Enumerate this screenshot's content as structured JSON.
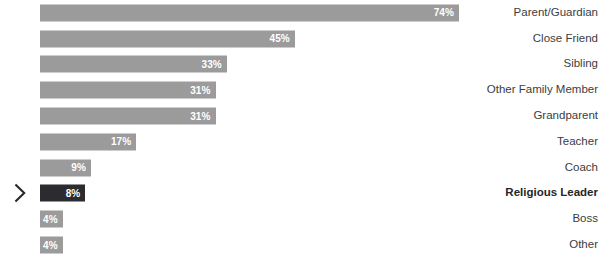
{
  "chart_data": {
    "type": "bar",
    "orientation": "horizontal",
    "title": "",
    "subtitle": "",
    "xlabel": "",
    "ylabel": "",
    "xlim": [
      0,
      74
    ],
    "grid": false,
    "legend": null,
    "value_suffix": "%",
    "categories": [
      "Parent/Guardian",
      "Close Friend",
      "Sibling",
      "Other Family Member",
      "Grandparent",
      "Teacher",
      "Coach",
      "Religious Leader",
      "Boss",
      "Other"
    ],
    "values": [
      74,
      45,
      33,
      31,
      31,
      17,
      9,
      8,
      4,
      4
    ],
    "value_labels": [
      "74%",
      "45%",
      "33%",
      "31%",
      "31%",
      "17%",
      "9%",
      "8%",
      "4%",
      "4%"
    ],
    "highlighted_index": 7,
    "highlighted_category": "Religious Leader",
    "marker_icon": "chevron-right-icon",
    "colors": {
      "bar": "#9b9b9b",
      "bar_highlight": "#2b2b30",
      "value_text": "#ffffff",
      "label_text": "#3c3c41",
      "label_text_highlight": "#26262a",
      "background": "#ffffff",
      "marker": "#26262a"
    }
  }
}
